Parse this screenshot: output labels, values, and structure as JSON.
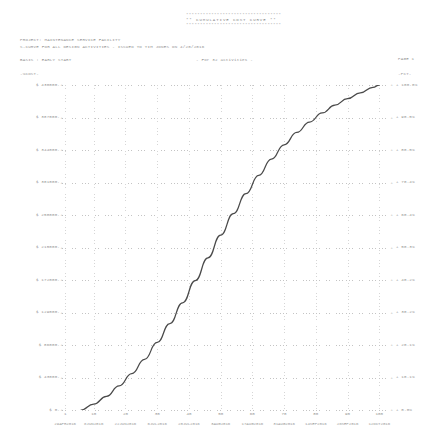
{
  "banner": {
    "stars_top": "**********************************",
    "title": "**  CUMULATIVE COST CURVE   **",
    "stars_bottom": "**********************************"
  },
  "header": {
    "project_line": "PROJECT:  MAINTENANCE SERVICE FACILITY",
    "curve_line": "S-CURVE FOR ALL DESIGN ACTIVITIES - ISSUED TO TIM JONES ON 4/20/2016",
    "basis_line": "BASIS : EARLY START",
    "activities_line": "- For  32 activities -",
    "page_label": "PAGE 1"
  },
  "axis_captions": {
    "cost": "-%COST-",
    "percent": "-PCT-"
  },
  "chart_data": {
    "type": "line",
    "title": "CUMULATIVE COST CURVE",
    "subtitle": "S-CURVE FOR ALL DESIGN ACTIVITIES",
    "xlabel": "WEEK / DATE",
    "ylabel": "CUMULATIVE COST ($)",
    "ylabel_right": "PERCENT COMPLETE",
    "grid": true,
    "legend": "none",
    "xlim": [
      0,
      104
    ],
    "ylim": [
      0,
      430000
    ],
    "ylim_right": [
      0.0,
      100.0
    ],
    "y_ticks_cost": [
      "$  430000.",
      "$  387000.",
      "$  344000.",
      "$  301000.",
      "$  258000.",
      "$  215000.",
      "$  172000.",
      "$  129000.",
      "$   86000.",
      "$   43000.",
      "$      0."
    ],
    "y_ticks_cost_values": [
      430000,
      387000,
      344000,
      301000,
      258000,
      215000,
      172000,
      129000,
      86000,
      43000,
      0
    ],
    "y_ticks_percent": [
      "100.0%",
      " 90.5%",
      " 80.5%",
      " 70.4%",
      " 60.4%",
      " 50.3%",
      " 40.2%",
      " 30.2%",
      " 20.1%",
      " 10.1%",
      "  0.0%"
    ],
    "y_ticks_percent_values": [
      100.0,
      90.5,
      80.5,
      70.4,
      60.4,
      50.3,
      40.2,
      30.2,
      20.1,
      10.1,
      0.0
    ],
    "x_ticks_week": [
      "0",
      "1",
      "10",
      "20",
      "30",
      "40",
      "50",
      "60",
      "70",
      "80",
      "90",
      "100"
    ],
    "x_ticks_dates": [
      "29APR2016",
      "8JUN2016",
      "22JUN2016",
      "6JUL2016",
      "20JUL2016",
      "3AUG2016",
      "17AUG2016",
      "31AUG2016",
      "14SEP2016",
      "28SEP2016",
      "12OCT2016"
    ],
    "x_tick_positions_week": [
      1,
      10,
      20,
      30,
      40,
      50,
      60,
      70,
      80,
      90,
      100
    ],
    "series": [
      {
        "name": "Cumulative Cost",
        "x": [
          6,
          10,
          14,
          18,
          22,
          26,
          30,
          34,
          38,
          42,
          46,
          50,
          54,
          58,
          62,
          66,
          70,
          74,
          78,
          82,
          86,
          90,
          94,
          98,
          100
        ],
        "y_percent": [
          0.0,
          1.8,
          4.2,
          7.4,
          11.2,
          15.6,
          20.8,
          26.6,
          33.0,
          39.8,
          46.8,
          53.8,
          60.4,
          66.6,
          72.2,
          77.2,
          81.6,
          85.4,
          88.6,
          91.4,
          93.8,
          95.8,
          97.6,
          99.3,
          100.0
        ],
        "y_cost": [
          0,
          7740,
          18060,
          31820,
          48160,
          67080,
          89440,
          114380,
          141900,
          171140,
          201240,
          231340,
          259720,
          286380,
          310460,
          331960,
          350880,
          367220,
          380980,
          393020,
          403340,
          411940,
          419680,
          426990,
          430000
        ]
      }
    ]
  }
}
